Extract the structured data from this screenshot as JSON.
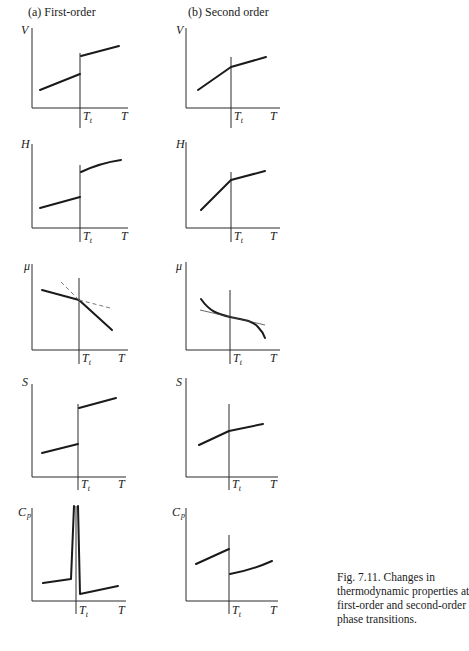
{
  "headers": {
    "left": "(a) First-order",
    "right": "(b) Second order"
  },
  "caption": {
    "lines": [
      "Fig. 7.11. Changes in",
      "thermodynamic properties at",
      "first-order and second-order",
      "phase transitions."
    ]
  },
  "axis_labels": {
    "x": "T",
    "transition": "T",
    "transition_sub": "t",
    "rows": [
      "V",
      "H",
      "μ",
      "S",
      "C",
      "p"
    ]
  },
  "panels": [
    {
      "row": "V",
      "column": "first-order",
      "behavior": "discontinuous jump at Tt"
    },
    {
      "row": "V",
      "column": "second-order",
      "behavior": "continuous, slope change at Tt"
    },
    {
      "row": "H",
      "column": "first-order",
      "behavior": "discontinuous jump at Tt"
    },
    {
      "row": "H",
      "column": "second-order",
      "behavior": "continuous, slope change at Tt"
    },
    {
      "row": "μ",
      "column": "first-order",
      "behavior": "continuous with kink at Tt; dashed metastable extensions"
    },
    {
      "row": "μ",
      "column": "second-order",
      "behavior": "smooth curve with inflection at Tt; thin tangent line"
    },
    {
      "row": "S",
      "column": "first-order",
      "behavior": "discontinuous jump at Tt"
    },
    {
      "row": "S",
      "column": "second-order",
      "behavior": "continuous, slope change at Tt"
    },
    {
      "row": "Cp",
      "column": "first-order",
      "behavior": "infinite spike at Tt"
    },
    {
      "row": "Cp",
      "column": "second-order",
      "behavior": "finite step drop at Tt"
    }
  ]
}
